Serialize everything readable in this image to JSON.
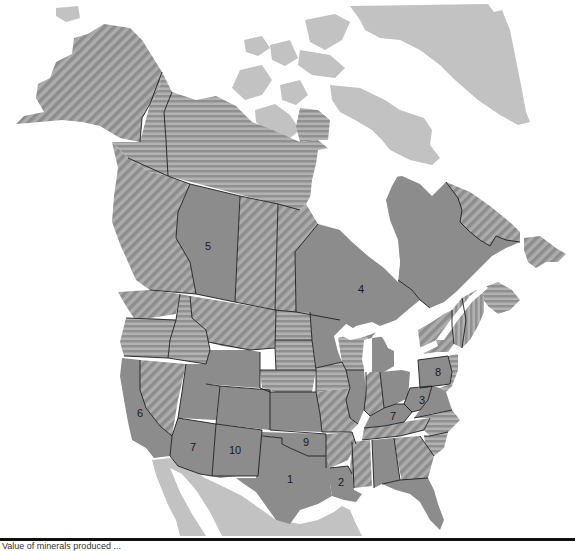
{
  "map": {
    "title": "North America regional ranking map",
    "colors": {
      "background": "#ffffff",
      "solid": "#8c8c8c",
      "hatch_base": "#a9a9a9",
      "hatch_stripe": "#8e8e8e",
      "light": "#c2c2c2",
      "border": "#1d1d1d"
    },
    "legend_fills": {
      "solid": "ranked region",
      "diagonal": "diagonal hatching",
      "horizontal": "horizontal hatching",
      "light": "outside study area"
    },
    "labels": [
      {
        "id": "region-1",
        "text": "1"
      },
      {
        "id": "region-2",
        "text": "2"
      },
      {
        "id": "region-3",
        "text": "3"
      },
      {
        "id": "region-4",
        "text": "4"
      },
      {
        "id": "region-5",
        "text": "5"
      },
      {
        "id": "region-6",
        "text": "6"
      },
      {
        "id": "region-7-west",
        "text": "7"
      },
      {
        "id": "region-7-east",
        "text": "7"
      },
      {
        "id": "region-8",
        "text": "8"
      },
      {
        "id": "region-9",
        "text": "9"
      },
      {
        "id": "region-10",
        "text": "10"
      }
    ]
  },
  "caption": {
    "text": "Value of minerals produced ..."
  }
}
